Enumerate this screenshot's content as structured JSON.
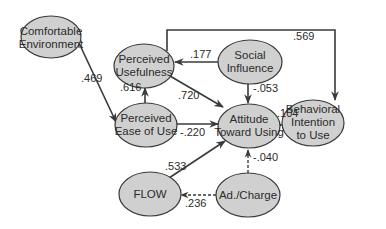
{
  "diagram": {
    "type": "structural-equation-model",
    "nodes": {
      "comfortable_environment": {
        "line1": "Comfortable",
        "line2": "Environment"
      },
      "perceived_usefulness": {
        "line1": "Perceived",
        "line2": "Usefulness"
      },
      "social_influence": {
        "line1": "Social",
        "line2": "Influence"
      },
      "perceived_ease_of_use": {
        "line1": "Perceived",
        "line2": "Ease of Use"
      },
      "attitude_toward_using": {
        "line1": "Attitude",
        "line2": "Toward Using"
      },
      "behavioral_intention": {
        "line1": "Behavioral",
        "line2": "Intention",
        "line3": "to Use"
      },
      "flow": {
        "line1": "FLOW"
      },
      "ad_charge": {
        "line1": "Ad./Charge"
      }
    },
    "edges": {
      "ce_to_peou": {
        "from": "Comfortable Environment",
        "to": "Perceived Ease of Use",
        "coef": ".469",
        "style": "solid"
      },
      "peou_to_pu": {
        "from": "Perceived Ease of Use",
        "to": "Perceived Usefulness",
        "coef": ".616",
        "style": "solid"
      },
      "si_to_pu": {
        "from": "Social Influence",
        "to": "Perceived Usefulness",
        "coef": ".177",
        "style": "solid"
      },
      "pu_to_att": {
        "from": "Perceived Usefulness",
        "to": "Attitude Toward Using",
        "coef": ".720",
        "style": "solid"
      },
      "si_to_att": {
        "from": "Social Influence",
        "to": "Attitude Toward Using",
        "coef": "-.053",
        "style": "solid"
      },
      "peou_to_att": {
        "from": "Perceived Ease of Use",
        "to": "Attitude Toward Using",
        "coef": "-.220",
        "style": "solid"
      },
      "att_to_bi": {
        "from": "Attitude Toward Using",
        "to": "Behavioral Intention to Use",
        "coef": ".104",
        "style": "solid"
      },
      "pu_to_bi": {
        "from": "Perceived Usefulness",
        "to": "Behavioral Intention to Use",
        "coef": ".569",
        "style": "solid"
      },
      "flow_to_att": {
        "from": "FLOW",
        "to": "Attitude Toward Using",
        "coef": ".533",
        "style": "solid"
      },
      "ad_to_att": {
        "from": "Ad./Charge",
        "to": "Attitude Toward Using",
        "coef": "-.040",
        "style": "dashed"
      },
      "ad_to_flow": {
        "from": "Ad./Charge",
        "to": "FLOW",
        "coef": ".236",
        "style": "dashed"
      }
    },
    "colors": {
      "node_fill": "#d0d0d0",
      "stroke": "#3a3a3a",
      "text": "#2b2b2b"
    }
  }
}
